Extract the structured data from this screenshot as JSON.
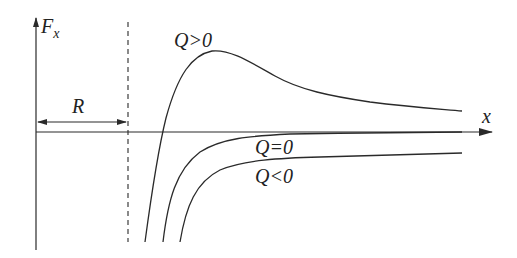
{
  "diagram": {
    "axes": {
      "y_label": "F",
      "y_label_sub": "x",
      "x_label": "x"
    },
    "dimension": {
      "label": "R"
    },
    "curves": [
      {
        "id": "q-positive",
        "label": "Q>0"
      },
      {
        "id": "q-zero",
        "label": "Q=0"
      },
      {
        "id": "q-negative",
        "label": "Q<0"
      }
    ],
    "colors": {
      "ink": "#2a2a2a",
      "background": "#ffffff"
    }
  }
}
